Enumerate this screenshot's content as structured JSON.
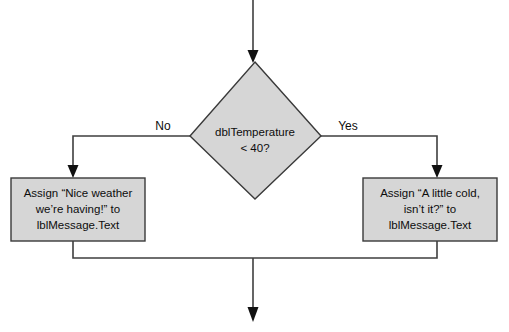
{
  "diagram": {
    "type": "flowchart",
    "colors": {
      "shape_fill": "#d6d6d6",
      "shape_stroke": "#3a3a3a",
      "connector": "#3f3f3f",
      "arrow": "#111111",
      "background": "#ffffff",
      "text": "#0d0d0d"
    },
    "decision": {
      "name": "temperature-decision",
      "line1": "dblTemperature",
      "line2": "< 40?"
    },
    "branches": {
      "no_label": "No",
      "yes_label": "Yes"
    },
    "process_left": {
      "name": "assign-nice-weather",
      "line1": "Assign “Nice weather",
      "line2": "we’re having!” to",
      "line3": "lblMessage.Text"
    },
    "process_right": {
      "name": "assign-little-cold",
      "line1": "Assign “A little cold,",
      "line2": "isn’t it?” to",
      "line3": "lblMessage.Text"
    }
  }
}
